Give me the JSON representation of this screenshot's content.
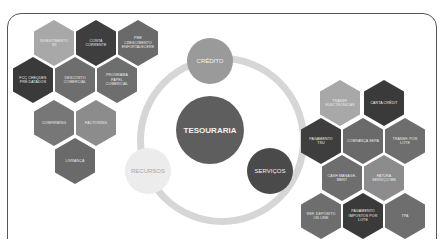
{
  "diagram": {
    "center": {
      "label": "TESOURARIA",
      "color": "#5e5e5e"
    },
    "nodes": [
      {
        "label": "CRÉDITO",
        "color": "#9a9a9a"
      },
      {
        "label": "SERVIÇOS",
        "color": "#4a4a4a"
      },
      {
        "label": "RECURSOS",
        "color": "#ececec",
        "text_color": "#aaaaaa"
      }
    ],
    "ring_color": "#d0d0d0",
    "left_cluster": [
      {
        "label": "INVESTIMENTO SÍÍ",
        "color": "#a8a8a8"
      },
      {
        "label": "CONTA CORRENTE",
        "color": "#3e3e3e"
      },
      {
        "label": "PME CRESCIMENTO ENFORTALECERE",
        "color": "#6a6a6a"
      },
      {
        "label": "FCC CHEQUES PRÉ DATADOS",
        "color": "#3a3a3a"
      },
      {
        "label": "DESCONTO COMERCIAL",
        "color": "#6e6e6e"
      },
      {
        "label": "PROGRAMA PAPEL COMERCIAL",
        "color": "#6e6e6e"
      },
      {
        "label": "CONFIRMING",
        "color": "#777777"
      },
      {
        "label": "FACTORING",
        "color": "#8c8c8c"
      },
      {
        "label": "LIVRANÇA",
        "color": "#6a6a6a"
      }
    ],
    "right_cluster": [
      {
        "label": "TRANSF. ELECTRÓNICAS",
        "color": "#a8a8a8"
      },
      {
        "label": "CARTA CRÉDIT",
        "color": "#3a3a3a"
      },
      {
        "label": "PAGAMENTO TSU",
        "color": "#3e3e3e"
      },
      {
        "label": "COBRANÇA SEPA",
        "color": "#6a6a6a"
      },
      {
        "label": "TRANSF. POR LOTE",
        "color": "#6e6e6e"
      },
      {
        "label": "CASH MANAGE-MENT",
        "color": "#6e6e6e"
      },
      {
        "label": "FATURA SERVIÇO MB",
        "color": "#8c8c8c"
      },
      {
        "label": "REF. DEPÓSITO ON LINE",
        "color": "#6e6e6e"
      },
      {
        "label": "PAGAMENTO IMPOSTOS POR LOTE",
        "color": "#3a3a3a"
      },
      {
        "label": "TPA",
        "color": "#6e6e6e"
      }
    ]
  }
}
